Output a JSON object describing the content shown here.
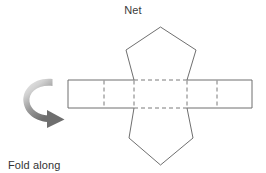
{
  "diagram": {
    "title": "Net",
    "kind": "pentagonal-prism-net",
    "caption": {
      "line1": "Fold along",
      "line2": "the dotted line"
    },
    "arrow": {
      "name": "curved-fold-arrow",
      "direction": "clockwise-down-right",
      "color_light": "#e8e8e8",
      "color_dark": "#6e6e6e"
    },
    "colors": {
      "solid_stroke": "#6f6f6f",
      "dashed_stroke": "#7a7a7a",
      "background": "#ffffff",
      "text": "#333333"
    },
    "geometry": {
      "band": {
        "left": 68,
        "right": 252,
        "top": 80,
        "bottom": 108
      },
      "center_face": {
        "left": 134,
        "right": 187
      },
      "fold_lines_x": [
        104,
        134,
        187,
        217
      ],
      "top_pentagon_apex": {
        "x": 160.5,
        "y": 27
      },
      "top_pentagon_shoulders": [
        {
          "x": 126,
          "y": 50
        },
        {
          "x": 196,
          "y": 50
        }
      ],
      "bottom_pentagon_apex": {
        "x": 160.5,
        "y": 165
      },
      "bottom_pentagon_shoulders": [
        {
          "x": 129,
          "y": 138
        },
        {
          "x": 193,
          "y": 138
        }
      ]
    }
  }
}
